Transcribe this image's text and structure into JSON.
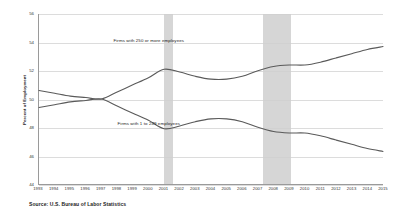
{
  "chart_data": {
    "type": "line",
    "title": "",
    "xlabel": "",
    "ylabel": "Percent of Employment",
    "ylim": [
      44,
      56
    ],
    "yticks": [
      44,
      46,
      48,
      50,
      52,
      54,
      56
    ],
    "grid": true,
    "legend_position": "inline-annotation",
    "x": [
      1993,
      1994,
      1995,
      1996,
      1997,
      1998,
      1999,
      2000,
      2001,
      2002,
      2003,
      2004,
      2005,
      2006,
      2007,
      2008,
      2009,
      2010,
      2011,
      2012,
      2013,
      2014,
      2015
    ],
    "series": [
      {
        "name": "Firms with 250 or more employees",
        "values": [
          50.6,
          50.4,
          50.2,
          50.1,
          50.0,
          50.5,
          51.0,
          51.5,
          52.1,
          51.9,
          51.6,
          51.4,
          51.4,
          51.6,
          52.0,
          52.3,
          52.4,
          52.4,
          52.6,
          52.9,
          53.2,
          53.5,
          53.7
        ]
      },
      {
        "name": "Firms with 1 to 249 employees",
        "values": [
          49.4,
          49.6,
          49.8,
          49.9,
          50.0,
          49.5,
          49.0,
          48.5,
          47.9,
          48.1,
          48.4,
          48.6,
          48.6,
          48.4,
          48.0,
          47.7,
          47.6,
          47.6,
          47.4,
          47.1,
          46.8,
          46.5,
          46.3
        ]
      }
    ],
    "annotations": [
      {
        "text": "Firms with 250 or more employees",
        "x": 2000,
        "y": 54.1
      },
      {
        "text": "Firms with 1 to 249 employees",
        "x": 2000,
        "y": 48.3
      }
    ],
    "recession_bands": [
      {
        "start": 2001.0,
        "end": 2001.55
      },
      {
        "start": 2007.3,
        "end": 2009.1
      }
    ],
    "source": "Source: U.S. Bureau of Labor Statistics",
    "colors": {
      "line": "#5a5a5a",
      "grid": "#dcdcdc",
      "axis": "#9a9a9a",
      "recession_band": "#cfcfcf",
      "background": "#ffffff",
      "text": "#1d1d1d"
    }
  }
}
